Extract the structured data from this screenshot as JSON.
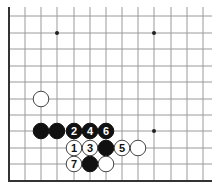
{
  "diagram": {
    "type": "go-board-fragment",
    "grid": {
      "columns_x": [
        9,
        25,
        41,
        57,
        74,
        90,
        106,
        122,
        138,
        154,
        171,
        187,
        203
      ],
      "rows_y": [
        16,
        33,
        49,
        66,
        82,
        99,
        115,
        131,
        148,
        164,
        180
      ],
      "line_extent": {
        "x_min": 9,
        "x_max": 212,
        "y_min": 7,
        "y_max": 181
      },
      "edges": [
        "left",
        "bottom"
      ],
      "line_color": "#9a9a9a",
      "edge_color": "#333333"
    },
    "star_points": [
      {
        "col": 3,
        "row": 1
      },
      {
        "col": 9,
        "row": 1
      },
      {
        "col": 9,
        "row": 7
      }
    ],
    "stones": [
      {
        "color": "white",
        "col": 2,
        "row": 5,
        "label": ""
      },
      {
        "color": "black",
        "col": 2,
        "row": 7,
        "label": ""
      },
      {
        "color": "black",
        "col": 3,
        "row": 7,
        "label": ""
      },
      {
        "color": "black",
        "col": 4,
        "row": 7,
        "label": "2"
      },
      {
        "color": "black",
        "col": 5,
        "row": 7,
        "label": "4"
      },
      {
        "color": "black",
        "col": 6,
        "row": 7,
        "label": "6"
      },
      {
        "color": "white",
        "col": 4,
        "row": 8,
        "label": "1"
      },
      {
        "color": "white",
        "col": 5,
        "row": 8,
        "label": "3"
      },
      {
        "color": "black",
        "col": 6,
        "row": 8,
        "label": ""
      },
      {
        "color": "white",
        "col": 7,
        "row": 8,
        "label": "5"
      },
      {
        "color": "white",
        "col": 8,
        "row": 8,
        "label": ""
      },
      {
        "color": "white",
        "col": 4,
        "row": 9,
        "label": "7"
      },
      {
        "color": "black",
        "col": 5,
        "row": 9,
        "label": ""
      },
      {
        "color": "white",
        "col": 6,
        "row": 9,
        "label": ""
      }
    ]
  }
}
